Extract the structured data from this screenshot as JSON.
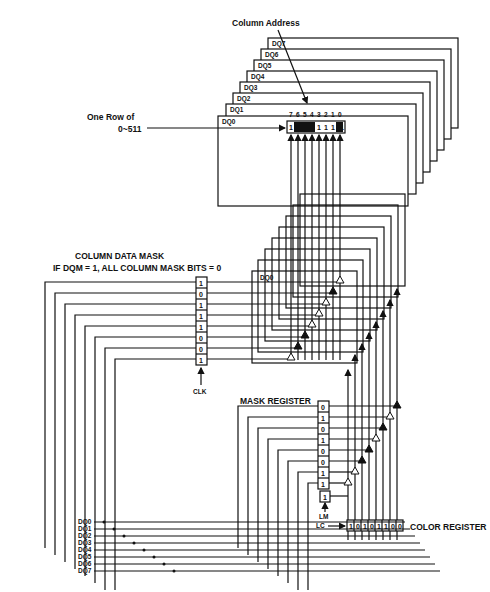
{
  "diagram": {
    "column_address_label": "Column Address",
    "row_label_line1": "One Row of",
    "row_label_line2": "0~511",
    "planes": [
      "DQ0",
      "DQ1",
      "DQ2",
      "DQ3",
      "DQ4",
      "DQ5",
      "DQ6",
      "DQ7"
    ],
    "bit_indices": [
      "7",
      "6",
      "5",
      "4",
      "3",
      "2",
      "1",
      "0"
    ],
    "memory_row_cells": [
      "1",
      "",
      "",
      "1",
      "1",
      "1",
      "",
      "1"
    ],
    "memory_row_dark": [
      false,
      true,
      true,
      false,
      false,
      false,
      true,
      false
    ],
    "column_mask": {
      "title_line1": "COLUMN DATA MASK",
      "title_line2": "IF DQM = 1, ALL COLUMN MASK BITS = 0",
      "bits": [
        "1",
        "0",
        "1",
        "1",
        "1",
        "0",
        "0",
        "1"
      ],
      "clock_label": "CLK"
    },
    "lower_plane_label": "DQ0",
    "column_mask_buffers_filled": [
      false,
      true,
      false,
      false,
      false,
      true,
      true,
      false
    ],
    "mask_register": {
      "title": "MASK REGISTER",
      "bits": [
        "0",
        "1",
        "0",
        "1",
        "0",
        "0",
        "1",
        "1"
      ],
      "buffers_filled": [
        true,
        false,
        true,
        false,
        true,
        true,
        false,
        false
      ]
    },
    "lm_register": {
      "bit": "1",
      "lm_label": "LM",
      "lc_label": "LC"
    },
    "color_register": {
      "title": "COLOR REGISTER",
      "bits": [
        "1",
        "0",
        "1",
        "0",
        "1",
        "1",
        "0",
        "0"
      ]
    },
    "dq_inputs": [
      "DQ0",
      "DQ1",
      "DQ2",
      "DQ3",
      "DQ4",
      "DQ5",
      "DQ6",
      "DQ7"
    ]
  }
}
